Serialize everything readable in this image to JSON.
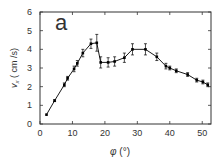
{
  "chart_data": {
    "type": "line",
    "title": "",
    "panel_label": "a",
    "xlabel": "φ (°)",
    "ylabel": "v_x (cm /s)",
    "xlim": [
      0,
      52.7
    ],
    "ylim": [
      0,
      6
    ],
    "xticks": [
      0,
      10,
      20,
      30,
      40,
      50
    ],
    "yticks": [
      0,
      1,
      2,
      3,
      4,
      5,
      6
    ],
    "grid": false,
    "legend": null,
    "series": [
      {
        "name": "v_x",
        "marker": "square",
        "color": "#000000",
        "x": [
          2,
          4.5,
          7.5,
          8.5,
          10.5,
          11.5,
          13.2,
          15.7,
          17.5,
          18.7,
          21,
          23,
          26,
          28.5,
          32.5,
          36,
          38.8,
          40,
          42,
          45.5,
          48.3,
          50.2,
          51.7
        ],
        "values": [
          0.5,
          1.25,
          2.1,
          2.45,
          2.95,
          3.25,
          3.8,
          4.3,
          4.35,
          3.3,
          3.3,
          3.35,
          3.55,
          4.0,
          4.0,
          3.6,
          3.1,
          3.0,
          2.85,
          2.65,
          2.35,
          2.25,
          2.1
        ],
        "errors": [
          0.0,
          0.05,
          0.1,
          0.1,
          0.15,
          0.15,
          0.2,
          0.25,
          0.45,
          0.3,
          0.25,
          0.25,
          0.25,
          0.3,
          0.3,
          0.2,
          0.15,
          0.1,
          0.1,
          0.1,
          0.1,
          0.1,
          0.1
        ]
      }
    ]
  },
  "labels": {
    "panel": "a",
    "xlabel_symbol": "φ",
    "xlabel_unit": " (°)",
    "ylabel_main": "v",
    "ylabel_sub": "x",
    "ylabel_unit": " ( cm /s)"
  }
}
